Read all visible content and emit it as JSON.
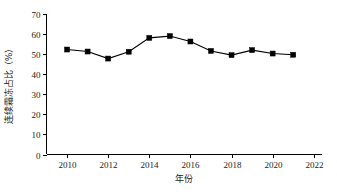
{
  "chart_data": {
    "type": "line",
    "title": "",
    "subtitle": "",
    "xlabel": "年份",
    "ylabel": "连续霜冻占比（%）",
    "xlim": [
      2009,
      2022.4
    ],
    "ylim": [
      0,
      70
    ],
    "xticks": [
      2010,
      2012,
      2014,
      2016,
      2018,
      2020,
      2022
    ],
    "xtick_labels": [
      "2010",
      "2012",
      "2014",
      "2016",
      "2018",
      "2020",
      "2022"
    ],
    "yticks": [
      0,
      10,
      20,
      30,
      40,
      50,
      60,
      70
    ],
    "ytick_labels": [
      "0",
      "10",
      "20",
      "30",
      "40",
      "50",
      "60",
      "70"
    ],
    "grid": false,
    "legend": false,
    "legend_position": "none",
    "marker": "square",
    "marker_color": "#000000",
    "line_color": "#000000",
    "x": [
      2010,
      2011,
      2012,
      2013,
      2014,
      2015,
      2016,
      2017,
      2018,
      2019,
      2020,
      2021
    ],
    "series": [
      {
        "name": "连续霜冻占比",
        "values": [
          52.3,
          51.3,
          47.8,
          51.2,
          58.1,
          59.0,
          56.3,
          51.6,
          49.5,
          52.0,
          50.3,
          49.7
        ]
      }
    ]
  },
  "axis": {
    "x_title": "年份",
    "y_title": "连续霜冻占比（%）"
  }
}
